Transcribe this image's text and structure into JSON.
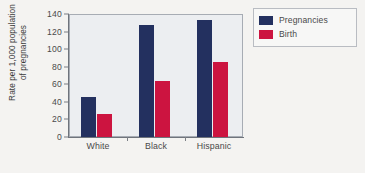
{
  "chart_data": {
    "type": "bar",
    "title": "",
    "xlabel": "",
    "ylabel_line1": "Rate per 1,000 population",
    "ylabel_line2": "of pregnancies",
    "categories": [
      "White",
      "Black",
      "Hispanic"
    ],
    "series": [
      {
        "name": "Pregnancies",
        "color": "#23305f",
        "values": [
          46,
          128,
          133
        ]
      },
      {
        "name": "Birth",
        "color": "#cc1440",
        "values": [
          26,
          64,
          85
        ]
      }
    ],
    "ylim": [
      0,
      140
    ],
    "yticks": [
      0,
      20,
      40,
      60,
      80,
      100,
      120,
      140
    ],
    "ytick_labels": [
      "0",
      "20",
      "40",
      "60",
      "80",
      "100",
      "120",
      "140"
    ],
    "grid": false,
    "legend_position": "top-right",
    "legend_entries": [
      "Pregnancies",
      "Birth"
    ]
  }
}
